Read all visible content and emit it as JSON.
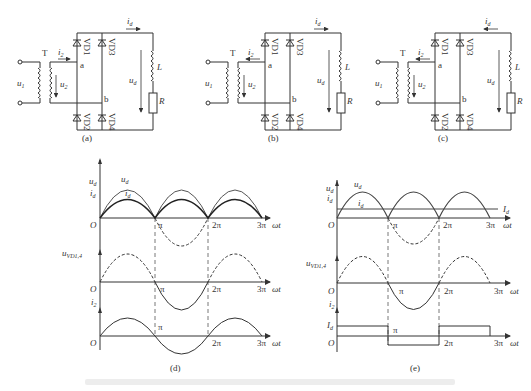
{
  "circuits": [
    {
      "id": "a",
      "caption": "(a)",
      "i2_direction": "right"
    },
    {
      "id": "b",
      "caption": "(b)",
      "i2_direction": "left"
    },
    {
      "id": "c",
      "caption": "(c)",
      "i2_direction": "left"
    }
  ],
  "circuit_labels": {
    "u1": "u",
    "u1_sub": "1",
    "u2": "u",
    "u2_sub": "2",
    "i2": "i",
    "i2_sub": "2",
    "id": "i",
    "id_sub": "d",
    "ud": "u",
    "ud_sub": "d",
    "T": "T",
    "a": "a",
    "b": "b",
    "L": "L",
    "R": "R",
    "VD1": "VD1",
    "VD2": "VD2",
    "VD3": "VD3",
    "VD4": "VD4"
  },
  "plots": {
    "d": {
      "caption": "(d)",
      "top": {
        "ylabel1": "u",
        "ylabel1_sub": "d",
        "ylabel2": "i",
        "ylabel2_sub": "d",
        "curve1": "u",
        "curve1_sub": "d",
        "curve2": "i",
        "curve2_sub": "d"
      },
      "mid": {
        "ylabel": "u",
        "ylabel_sub": "VD1,4"
      },
      "bot": {
        "ylabel": "i",
        "ylabel_sub": "2"
      }
    },
    "e": {
      "caption": "(e)",
      "top": {
        "ylabel1": "u",
        "ylabel1_sub": "d",
        "ylabel2": "i",
        "ylabel2_sub": "d",
        "curve1": "u",
        "curve1_sub": "d",
        "curve2": "i",
        "curve2_sub": "d",
        "level": "I",
        "level_sub": "d"
      },
      "mid": {
        "ylabel": "u",
        "ylabel_sub": "VD1,4"
      },
      "bot": {
        "ylabel": "i",
        "ylabel_sub": "2",
        "level": "I",
        "level_sub": "d"
      }
    }
  },
  "axis_ticks": {
    "origin": "O",
    "pi": "π",
    "two_pi": "2π",
    "three_pi": "3π",
    "xlabel": "ωt"
  }
}
